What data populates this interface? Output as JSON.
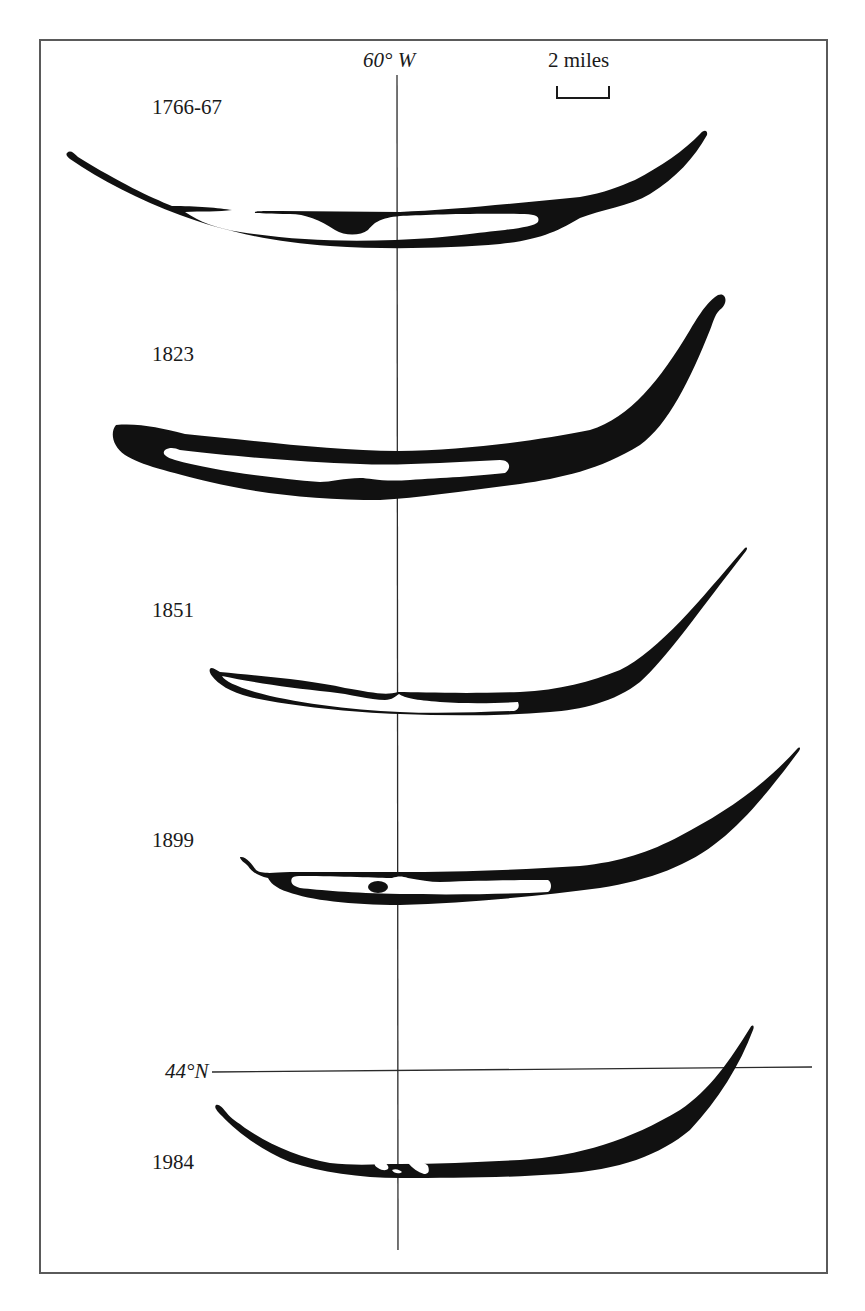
{
  "figure": {
    "title": "",
    "meridian": {
      "label": "60° W"
    },
    "parallel": {
      "label": "44°N"
    },
    "scale_bar": {
      "label": "2 miles"
    },
    "islands": [
      {
        "year": "1766-67"
      },
      {
        "year": "1823"
      },
      {
        "year": "1851"
      },
      {
        "year": "1899"
      },
      {
        "year": "1984"
      }
    ],
    "colors": {
      "land": "#111111",
      "lagoon": "#ffffff",
      "lines": "#2a2a2a",
      "frame": "#5a5a5a"
    }
  }
}
